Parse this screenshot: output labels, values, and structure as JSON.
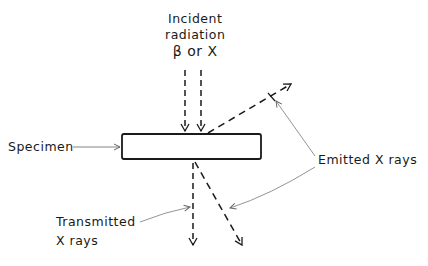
{
  "diagram": {
    "incident_label": [
      "Incident",
      "radiation",
      "β or X"
    ],
    "specimen_label": "Specimen",
    "emitted_label": "Emitted X rays",
    "transmitted_label": [
      "Transmitted",
      "X rays"
    ],
    "colors": {
      "ink": "#1a1a1a",
      "leader": "#777777"
    }
  }
}
